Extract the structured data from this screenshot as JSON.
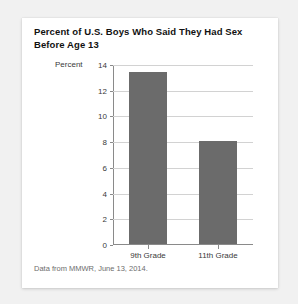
{
  "card": {
    "title": "Percent of U.S. Boys Who Said They Had Sex Before Age 13",
    "source_note": "Data from MMWR, June 13, 2014."
  },
  "chart_data": {
    "type": "bar",
    "title": "Percent of U.S. Boys Who Said They Had Sex Before Age 13",
    "xlabel": "",
    "ylabel": "Percent",
    "categories": [
      "9th Grade",
      "11th Grade"
    ],
    "values": [
      13.4,
      8.0
    ],
    "ylim": [
      0,
      14
    ],
    "yticks": [
      0,
      2,
      4,
      6,
      8,
      10,
      12,
      14
    ],
    "ytick_labels": [
      "0",
      "2",
      "4",
      "6",
      "8",
      "10",
      "12",
      "14"
    ],
    "grid": true,
    "legend": false,
    "bar_color": "#6b6b6b",
    "gridline_color": "#d2d2d2",
    "axis_color": "#8a8a8a"
  }
}
